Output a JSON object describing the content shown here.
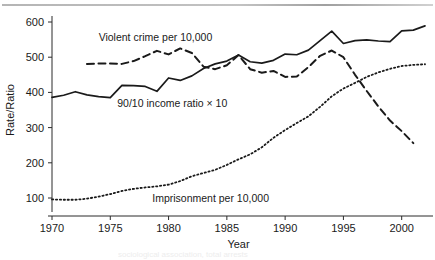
{
  "figure": {
    "top_rule": "horizontal-rule",
    "cut_caption": "sociological association, total arrests"
  },
  "chart_data": {
    "type": "line",
    "title": "",
    "xlabel": "Year",
    "ylabel": "Rate/Ratio",
    "xlim": [
      1970,
      2002
    ],
    "ylim": [
      60,
      620
    ],
    "grid": false,
    "legend": "inline-annotations",
    "xticks": [
      1970,
      1975,
      1980,
      1985,
      1990,
      1995,
      2000
    ],
    "xtick_labels": [
      "1970",
      "1975",
      "1980",
      "1985",
      "1990",
      "1995",
      "2000"
    ],
    "yticks": [
      100,
      200,
      300,
      400,
      500,
      600
    ],
    "ytick_labels": [
      "100",
      "200",
      "300",
      "400",
      "500",
      "600"
    ],
    "series": [
      {
        "name": "Violent crime per 10,000",
        "style": "dashed",
        "color": "#1a1a1a",
        "label_x": 1974.0,
        "label_y": 556,
        "x": [
          1973,
          1974,
          1975,
          1976,
          1977,
          1978,
          1979,
          1980,
          1981,
          1982,
          1983,
          1984,
          1985,
          1986,
          1987,
          1988,
          1989,
          1990,
          1991,
          1992,
          1993,
          1994,
          1995,
          1996,
          1997,
          1998,
          1999,
          2000,
          2001
        ],
        "values": [
          481,
          482,
          482,
          481,
          489,
          503,
          518,
          508,
          525,
          512,
          473,
          466,
          477,
          506,
          466,
          456,
          461,
          444,
          445,
          472,
          504,
          519,
          500,
          450,
          404,
          360,
          320,
          290,
          256
        ]
      },
      {
        "name": "90/10 income ratio × 10",
        "style": "solid",
        "color": "#1a1a1a",
        "label_x": 1975.6,
        "label_y": 369,
        "x": [
          1970,
          1971,
          1972,
          1973,
          1974,
          1975,
          1976,
          1977,
          1978,
          1979,
          1980,
          1981,
          1982,
          1983,
          1984,
          1985,
          1986,
          1987,
          1988,
          1989,
          1990,
          1991,
          1992,
          1993,
          1994,
          1995,
          1996,
          1997,
          1998,
          1999,
          2000,
          2001,
          2002
        ],
        "values": [
          386,
          392,
          402,
          393,
          388,
          385,
          420,
          419,
          417,
          403,
          441,
          434,
          447,
          468,
          481,
          489,
          506,
          487,
          483,
          491,
          509,
          507,
          520,
          547,
          574,
          539,
          547,
          549,
          546,
          544,
          575,
          577,
          589
        ]
      },
      {
        "name": "Imprisonment per 10,000",
        "style": "dotted",
        "color": "#1a1a1a",
        "label_x": 1978.6,
        "label_y": 100,
        "x": [
          1970,
          1971,
          1972,
          1973,
          1974,
          1975,
          1976,
          1977,
          1978,
          1979,
          1980,
          1981,
          1982,
          1983,
          1984,
          1985,
          1986,
          1987,
          1988,
          1989,
          1990,
          1991,
          1992,
          1993,
          1994,
          1995,
          1996,
          1997,
          1998,
          1999,
          2000,
          2001,
          2002
        ],
        "values": [
          96,
          95,
          95,
          98,
          104,
          111,
          120,
          126,
          130,
          133,
          138,
          148,
          162,
          171,
          180,
          194,
          210,
          224,
          244,
          271,
          293,
          313,
          332,
          359,
          389,
          411,
          427,
          444,
          457,
          467,
          475,
          478,
          480
        ]
      }
    ]
  }
}
